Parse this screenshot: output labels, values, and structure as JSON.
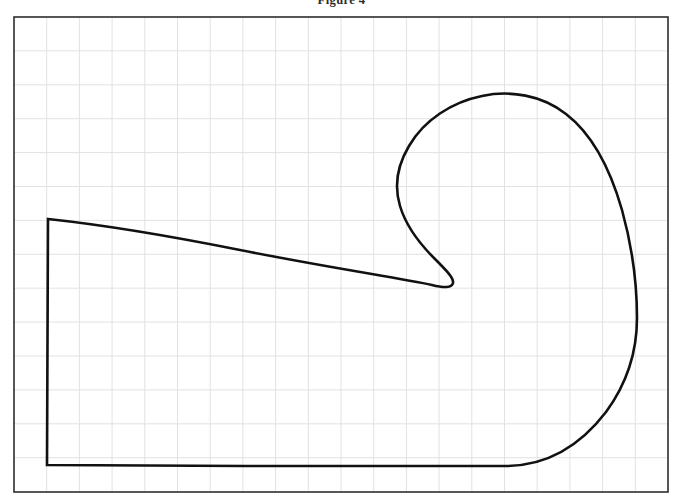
{
  "caption": {
    "text": "Figure 4"
  },
  "figure": {
    "title": "Figure 4",
    "background_color": "#ffffff",
    "stroke_color": "#111111",
    "border_color": "#2d2d2d",
    "grid_color": "#e2e2e2",
    "curve_stroke_width": 2.6,
    "border_stroke_width": 1.6,
    "grid_stroke_width": 1.0
  },
  "chart_data": {
    "type": "line",
    "title": "Figure 4",
    "subtitle": "",
    "xlabel": "",
    "ylabel": "",
    "grid": true,
    "legend": "none",
    "axis_ticks_visible": false,
    "plot_area": {
      "left": 14,
      "top": 17,
      "right": 668,
      "bottom": 492,
      "width": 654,
      "height": 475
    },
    "grid_spec": {
      "columns": 20,
      "rows": 14,
      "cell_width": 32.7,
      "cell_height": 33.9,
      "x_lines": [
        14,
        46.7,
        79.4,
        112.1,
        144.8,
        177.5,
        210.2,
        242.9,
        275.6,
        308.3,
        341,
        373.7,
        406.4,
        439.1,
        471.8,
        504.5,
        537.2,
        569.9,
        602.6,
        635.3,
        668
      ],
      "y_lines": [
        17,
        50.9,
        84.8,
        118.7,
        152.6,
        186.5,
        220.4,
        254.3,
        288.2,
        322.1,
        356,
        389.9,
        423.8,
        457.7,
        492
      ]
    },
    "series": [
      {
        "name": "closed-hook-outline",
        "closed": true,
        "description": "Closed shepherd's-crook / hook shaped region outline",
        "key_points": {
          "sharp_corner_top_left": [
            48,
            219
          ],
          "bottom_left_corner": [
            47,
            465
          ],
          "bottom_flat_end": [
            510,
            466
          ],
          "rightmost_bulge": [
            637,
            318
          ],
          "top_arc_peak": [
            478,
            96
          ],
          "inner_arc_leftmost": [
            396,
            185
          ],
          "inner_notch_tip": [
            455,
            272
          ]
        },
        "path": "M 48 219 L 47 465 L 245 466 L 400 466 L 505 466 C 546 466 580 446 606 412 C 628 382 637 350 637 318 C 637 282 632 246 622 210 C 610 168 592 134 566 114 C 542 95 510 90 482 96 C 452 102 424 120 409 146 C 397 166 394 186 400 206 C 406 226 420 244 434 258 C 446 270 454 278 453 283 C 452 288 444 288 432 285 C 400 278 330 268 240 250 C 160 234 95 224 48 219 Z"
      }
    ]
  }
}
